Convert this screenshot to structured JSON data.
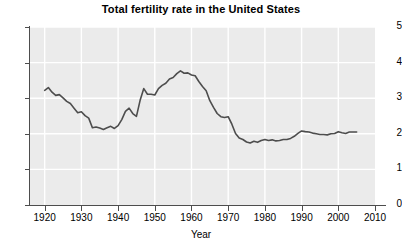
{
  "chart_data": {
    "type": "line",
    "title": "Total fertility rate in the United States",
    "xlabel": "Year",
    "ylabel": "",
    "xlim": [
      1916,
      2010
    ],
    "ylim": [
      0,
      5
    ],
    "xticks": [
      1920,
      1930,
      1940,
      1950,
      1960,
      1970,
      1980,
      1990,
      2000,
      2010
    ],
    "yticks": [
      0,
      1,
      2,
      3,
      4,
      5
    ],
    "grid": true,
    "legend": "none",
    "line_color": "#4d4d4d",
    "plot_background": "#ebebeb",
    "gridline_color": "#ffffff",
    "page_background": "#ffffff",
    "series": [
      {
        "name": "Total fertility rate",
        "x": [
          1920,
          1921,
          1922,
          1923,
          1924,
          1925,
          1926,
          1927,
          1928,
          1929,
          1930,
          1931,
          1932,
          1933,
          1934,
          1935,
          1936,
          1937,
          1938,
          1939,
          1940,
          1941,
          1942,
          1943,
          1944,
          1945,
          1946,
          1947,
          1948,
          1949,
          1950,
          1951,
          1952,
          1953,
          1954,
          1955,
          1956,
          1957,
          1958,
          1959,
          1960,
          1961,
          1962,
          1963,
          1964,
          1965,
          1966,
          1967,
          1968,
          1969,
          1970,
          1971,
          1972,
          1973,
          1974,
          1975,
          1976,
          1977,
          1978,
          1979,
          1980,
          1981,
          1982,
          1983,
          1984,
          1985,
          1986,
          1987,
          1988,
          1989,
          1990,
          1991,
          1992,
          1993,
          1994,
          1995,
          1996,
          1997,
          1998,
          1999,
          2000,
          2001,
          2002,
          2003,
          2004,
          2005
        ],
        "values": [
          3.22,
          3.3,
          3.17,
          3.08,
          3.1,
          3.01,
          2.91,
          2.85,
          2.72,
          2.59,
          2.62,
          2.51,
          2.44,
          2.17,
          2.19,
          2.16,
          2.12,
          2.17,
          2.21,
          2.15,
          2.23,
          2.4,
          2.63,
          2.72,
          2.57,
          2.49,
          2.94,
          3.27,
          3.11,
          3.11,
          3.09,
          3.27,
          3.36,
          3.42,
          3.54,
          3.58,
          3.69,
          3.77,
          3.7,
          3.71,
          3.65,
          3.63,
          3.47,
          3.33,
          3.21,
          2.93,
          2.74,
          2.57,
          2.48,
          2.46,
          2.48,
          2.27,
          2.01,
          1.88,
          1.84,
          1.77,
          1.74,
          1.79,
          1.76,
          1.81,
          1.84,
          1.81,
          1.83,
          1.8,
          1.81,
          1.84,
          1.84,
          1.87,
          1.93,
          2.01,
          2.08,
          2.06,
          2.05,
          2.02,
          2.0,
          1.98,
          1.98,
          1.97,
          2.0,
          2.01,
          2.06,
          2.03,
          2.01,
          2.05,
          2.05,
          2.05
        ]
      }
    ]
  }
}
